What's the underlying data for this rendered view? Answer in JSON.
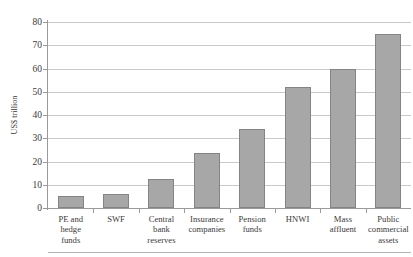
{
  "chart_data": {
    "type": "bar",
    "title": "",
    "xlabel": "",
    "ylabel": "US$ trillion",
    "ylim": [
      0,
      80
    ],
    "ytick_step": 10,
    "yticks": [
      80,
      70,
      60,
      50,
      40,
      30,
      20,
      10,
      0
    ],
    "grid": true,
    "legend": "none",
    "bar_color": "#a7a7a7",
    "bar_border_color": "#848484",
    "gridline_color": "#c9c9c9",
    "axis_color": "#9a9a9a",
    "background_color": "#ffffff",
    "categories": [
      "PE and hedge funds",
      "SWF",
      "Central bank reserves",
      "Insurance companies",
      "Pension funds",
      "HNWI",
      "Mass affluent",
      "Public commercial assets"
    ],
    "category_lines": [
      [
        "PE and",
        "hedge",
        "funds"
      ],
      [
        "SWF"
      ],
      [
        "Central",
        "bank",
        "reserves"
      ],
      [
        "Insurance",
        "companies"
      ],
      [
        "Pension",
        "funds"
      ],
      [
        "HNWI"
      ],
      [
        "Mass",
        "affluent"
      ],
      [
        "Public",
        "commercial",
        "assets"
      ]
    ],
    "values": [
      5.2,
      6.0,
      12.5,
      23.7,
      34.0,
      52.0,
      60.0,
      74.7
    ]
  }
}
